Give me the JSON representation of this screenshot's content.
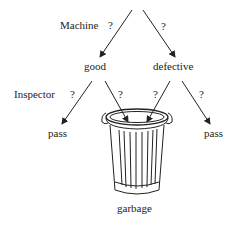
{
  "diagram": {
    "type": "decision-tree",
    "labels": {
      "machine": "Machine",
      "q_machine_left": "?",
      "q_machine_right": "?",
      "good": "good",
      "defective": "defective",
      "inspector": "Inspector",
      "q_inspector_1": "?",
      "q_inspector_2": "?",
      "q_inspector_3": "?",
      "q_inspector_4": "?",
      "pass_left": "pass",
      "pass_right": "pass",
      "garbage": "garbage"
    },
    "nodes": [
      "good",
      "defective",
      "pass",
      "garbage",
      "pass"
    ],
    "edges": [
      {
        "from": "root",
        "to": "good",
        "label": "Machine ?"
      },
      {
        "from": "root",
        "to": "defective",
        "label": "?"
      },
      {
        "from": "good",
        "to": "pass",
        "label": "Inspector ?"
      },
      {
        "from": "good",
        "to": "garbage",
        "label": "?"
      },
      {
        "from": "defective",
        "to": "garbage",
        "label": "?"
      },
      {
        "from": "defective",
        "to": "pass",
        "label": "?"
      }
    ],
    "colors": {
      "ink": "#222222",
      "background": "#ffffff"
    }
  }
}
